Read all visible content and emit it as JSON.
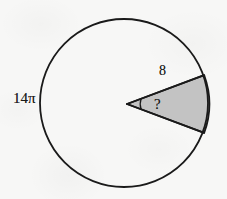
{
  "figure": {
    "kind": "geometry-diagram",
    "background_color": "#f7f7f6",
    "stroke_color": "#1a1a1a",
    "sector_fill_color": "#c3c3c3",
    "circle": {
      "center_x": 124,
      "center_y": 103,
      "radius": 84,
      "fill": "none",
      "stroke_width": 1.8
    },
    "sector": {
      "vertex_x": 127,
      "vertex_y": 104,
      "start_angle_deg": -20,
      "end_angle_deg": 20,
      "upper_endpoint_x": 204,
      "upper_endpoint_y": 75,
      "lower_endpoint_x": 203,
      "lower_endpoint_y": 133,
      "stroke_width": 1.8
    },
    "angle_arc": {
      "radius": 15,
      "stroke_width": 1.3
    },
    "labels": {
      "diameter": "14π",
      "radius": "8",
      "angle": "?"
    }
  }
}
